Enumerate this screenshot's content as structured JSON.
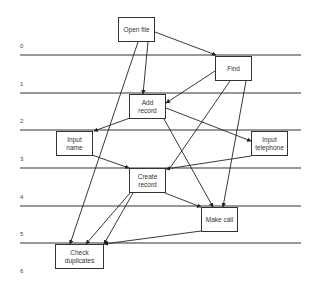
{
  "diagram": {
    "type": "layered-task-graph",
    "line_color": "#333333",
    "rows": [
      {
        "label": "0",
        "y": 55
      },
      {
        "label": "1",
        "y": 93
      },
      {
        "label": "2",
        "y": 130
      },
      {
        "label": "3",
        "y": 168
      },
      {
        "label": "4",
        "y": 206
      },
      {
        "label": "5",
        "y": 243
      },
      {
        "label": "6",
        "y": null
      }
    ],
    "nodes": [
      {
        "id": "open_file",
        "label": "Open file",
        "x": 118,
        "y": 17,
        "w": 37,
        "h": 25
      },
      {
        "id": "find",
        "label": "Find",
        "x": 215,
        "y": 56,
        "w": 37,
        "h": 25
      },
      {
        "id": "add_record",
        "label": "Add\nrecord",
        "x": 129,
        "y": 94,
        "w": 37,
        "h": 25
      },
      {
        "id": "input_name",
        "label": "Input\nname",
        "x": 56,
        "y": 131,
        "w": 37,
        "h": 25
      },
      {
        "id": "input_telephone",
        "label": "Input\ntelephone",
        "x": 251,
        "y": 131,
        "w": 37,
        "h": 25
      },
      {
        "id": "create_record",
        "label": "Create\nrecord",
        "x": 129,
        "y": 168,
        "w": 37,
        "h": 25
      },
      {
        "id": "make_call",
        "label": "Make call",
        "x": 201,
        "y": 207,
        "w": 37,
        "h": 25
      },
      {
        "id": "check_duplicates",
        "label": "Check\nduplicates",
        "x": 55,
        "y": 244,
        "w": 49,
        "h": 25
      }
    ],
    "edges": [
      {
        "from": "open_file",
        "to": "find"
      },
      {
        "from": "open_file",
        "to": "add_record"
      },
      {
        "from": "open_file",
        "to": "check_duplicates"
      },
      {
        "from": "find",
        "to": "add_record"
      },
      {
        "from": "find",
        "to": "create_record"
      },
      {
        "from": "find",
        "to": "make_call"
      },
      {
        "from": "add_record",
        "to": "input_name"
      },
      {
        "from": "add_record",
        "to": "input_telephone"
      },
      {
        "from": "add_record",
        "to": "make_call"
      },
      {
        "from": "input_name",
        "to": "create_record"
      },
      {
        "from": "input_telephone",
        "to": "create_record"
      },
      {
        "from": "create_record",
        "to": "check_duplicates"
      },
      {
        "from": "create_record",
        "to": "make_call"
      },
      {
        "from": "make_call",
        "to": "check_duplicates"
      }
    ]
  }
}
